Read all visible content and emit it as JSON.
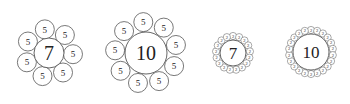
{
  "diagrams": [
    {
      "center_label": "7",
      "ring_label": "5",
      "ring_count": 7,
      "cx": 49,
      "cy": 53,
      "center_r": 15,
      "ring_r": 9.5,
      "ring_dist": 24,
      "start_deg": -100,
      "center_font": 20,
      "ring_font": 9
    },
    {
      "center_label": "10",
      "ring_label": "5",
      "ring_count": 9,
      "cx": 146,
      "cy": 53,
      "center_r": 21,
      "ring_r": 9.5,
      "ring_dist": 31,
      "start_deg": -95,
      "center_font": 20,
      "ring_font": 9
    },
    {
      "center_label": "7",
      "ring_label": "2",
      "ring_count": 17,
      "cx": 233,
      "cy": 53,
      "center_r": 13,
      "ring_r": 3.6,
      "ring_dist": 17,
      "start_deg": -90,
      "center_font": 17,
      "ring_font": 4.5
    },
    {
      "center_label": "10",
      "ring_label": "2",
      "ring_count": 22,
      "cx": 311,
      "cy": 52,
      "center_r": 18,
      "ring_r": 3.6,
      "ring_dist": 22,
      "start_deg": -90,
      "center_font": 17,
      "ring_font": 4.5
    }
  ],
  "colors": {
    "stroke": "#555555",
    "text": "#222222",
    "background": "#ffffff"
  }
}
